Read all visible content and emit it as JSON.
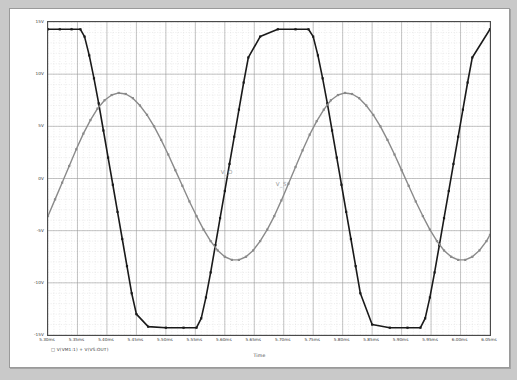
{
  "window": {
    "background_color": "#c9c9c9",
    "plot_background": "#ffffff",
    "frame_color": "#4a4a4a"
  },
  "axis": {
    "x_title": "Time",
    "y_tick_labels": [
      "15V",
      "10V",
      "5V",
      "0V",
      "-5V",
      "-10V",
      "-15V"
    ],
    "x_tick_labels": [
      "5.30ms",
      "5.35ms",
      "5.40ms",
      "5.45ms",
      "5.50ms",
      "5.55ms",
      "5.60ms",
      "5.65ms",
      "5.70ms",
      "5.75ms",
      "5.80ms",
      "5.85ms",
      "5.90ms",
      "5.95ms",
      "6.00ms",
      "6.05ms"
    ]
  },
  "legend": {
    "entries": [
      {
        "marker": "□",
        "text": "V(VM1:1)",
        "color": "#1a1a1a"
      },
      {
        "marker": "+",
        "text": "V(VS:OUT)",
        "color": "#8a8a8a"
      }
    ],
    "full_text": "□ V(VM1:1)   + V(VS:OUT)"
  },
  "trace_labels": [
    {
      "text": "V_O",
      "color": "#9a9a9a"
    },
    {
      "text": "V_S",
      "color": "#9a9a9a"
    }
  ],
  "chart_data": {
    "type": "line",
    "title": "",
    "xlabel": "Time",
    "ylabel": "",
    "xlim": [
      5.3,
      6.05
    ],
    "ylim": [
      -15,
      15
    ],
    "xunit": "ms",
    "yunit": "V",
    "grid": true,
    "grid_major_x": 0.05,
    "grid_major_y": 5,
    "grid_minor_x": 0.01,
    "grid_minor_y": 1,
    "legend_position": "below-axis",
    "series": [
      {
        "name": "V(VM1:1)",
        "label": "V_O",
        "color": "#1a1a1a",
        "width": 1.6,
        "markers": true,
        "description": "Clipped / saturated output waveform, square-like with sloped edges, rails at +14.3V and -14.3V",
        "x": [
          5.3,
          5.32,
          5.34,
          5.355,
          5.362,
          5.37,
          5.378,
          5.386,
          5.394,
          5.402,
          5.41,
          5.418,
          5.426,
          5.434,
          5.442,
          5.45,
          5.47,
          5.5,
          5.53,
          5.552,
          5.56,
          5.568,
          5.576,
          5.584,
          5.592,
          5.6,
          5.608,
          5.616,
          5.624,
          5.632,
          5.64,
          5.66,
          5.69,
          5.72,
          5.742,
          5.75,
          5.758,
          5.766,
          5.774,
          5.782,
          5.79,
          5.798,
          5.806,
          5.814,
          5.822,
          5.83,
          5.85,
          5.88,
          5.91,
          5.932,
          5.94,
          5.948,
          5.956,
          5.964,
          5.972,
          5.98,
          5.988,
          5.996,
          6.004,
          6.012,
          6.02,
          6.05
        ],
        "y": [
          14.3,
          14.3,
          14.3,
          14.3,
          13.6,
          11.8,
          9.6,
          7.2,
          4.6,
          2.0,
          -0.6,
          -3.2,
          -5.8,
          -8.4,
          -11.0,
          -13.0,
          -14.2,
          -14.3,
          -14.3,
          -14.3,
          -13.4,
          -11.4,
          -9.0,
          -6.4,
          -3.8,
          -1.2,
          1.4,
          4.0,
          6.6,
          9.2,
          11.6,
          13.6,
          14.3,
          14.3,
          14.3,
          13.6,
          11.8,
          9.6,
          7.2,
          4.6,
          2.0,
          -0.6,
          -3.2,
          -5.8,
          -8.4,
          -11.0,
          -14.0,
          -14.3,
          -14.3,
          -14.3,
          -13.4,
          -11.4,
          -9.0,
          -6.4,
          -3.8,
          -1.2,
          1.4,
          4.0,
          6.6,
          9.2,
          11.6,
          14.3
        ]
      },
      {
        "name": "V(VS:OUT)",
        "label": "V_S",
        "color": "#8a8a8a",
        "width": 1.4,
        "markers": true,
        "description": "Sinusoidal source waveform, amplitude about 8.2V, period about 0.30ms",
        "x": [
          5.3,
          5.312,
          5.324,
          5.336,
          5.348,
          5.36,
          5.372,
          5.384,
          5.396,
          5.408,
          5.42,
          5.432,
          5.444,
          5.456,
          5.468,
          5.48,
          5.492,
          5.504,
          5.516,
          5.528,
          5.54,
          5.552,
          5.564,
          5.576,
          5.588,
          5.6,
          5.612,
          5.624,
          5.636,
          5.648,
          5.66,
          5.672,
          5.684,
          5.696,
          5.708,
          5.72,
          5.732,
          5.744,
          5.756,
          5.768,
          5.78,
          5.792,
          5.804,
          5.816,
          5.828,
          5.84,
          5.852,
          5.864,
          5.876,
          5.888,
          5.9,
          5.912,
          5.924,
          5.936,
          5.948,
          5.96,
          5.972,
          5.984,
          5.996,
          6.008,
          6.02,
          6.032,
          6.044,
          6.05
        ],
        "y": [
          -3.6,
          -2.0,
          -0.4,
          1.2,
          2.8,
          4.3,
          5.6,
          6.7,
          7.5,
          8.0,
          8.2,
          8.1,
          7.7,
          7.0,
          6.1,
          5.0,
          3.7,
          2.3,
          0.8,
          -0.7,
          -2.2,
          -3.6,
          -4.9,
          -6.0,
          -6.9,
          -7.5,
          -7.8,
          -7.8,
          -7.5,
          -6.9,
          -6.0,
          -4.9,
          -3.6,
          -2.1,
          -0.5,
          1.1,
          2.7,
          4.2,
          5.5,
          6.6,
          7.5,
          8.0,
          8.2,
          8.1,
          7.7,
          7.0,
          6.1,
          5.0,
          3.7,
          2.3,
          0.8,
          -0.7,
          -2.2,
          -3.6,
          -4.9,
          -6.0,
          -6.9,
          -7.5,
          -7.8,
          -7.8,
          -7.5,
          -6.9,
          -6.0,
          -5.4
        ]
      }
    ]
  }
}
